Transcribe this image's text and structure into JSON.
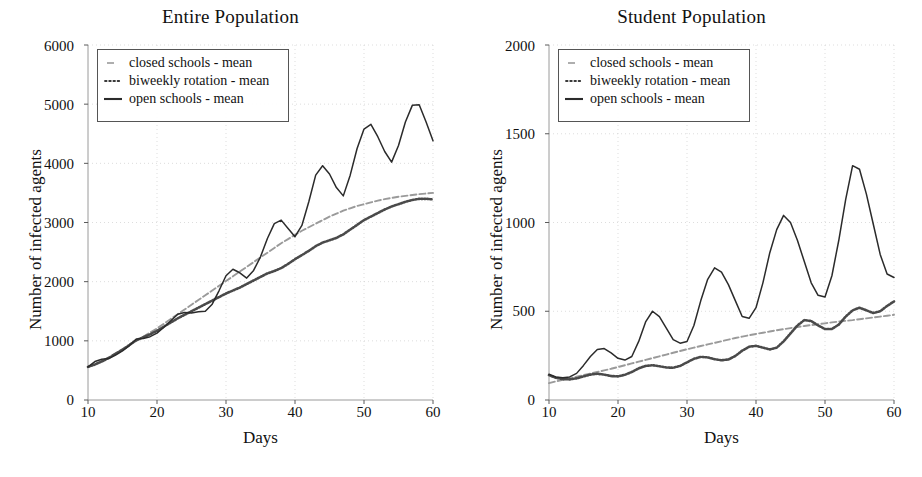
{
  "figure": {
    "background": "#ffffff",
    "ink": "#1a1a1a"
  },
  "legend": {
    "entries": [
      {
        "label": "closed schools - mean",
        "key": "dashed-line-key",
        "style": "dashed",
        "color": "#9a9a9a"
      },
      {
        "label": "biweekly rotation - mean",
        "key": "dotted-line-key",
        "style": "dotted",
        "color": "#4a4a4a"
      },
      {
        "label": "open schools - mean",
        "key": "solid-line-key",
        "style": "solid",
        "color": "#2b2b2b"
      }
    ]
  },
  "panels": [
    {
      "name": "entire-population",
      "title": "Entire Population",
      "xlabel": "Days",
      "ylabel": "Number of infected agents",
      "xticks": [
        "10",
        "20",
        "30",
        "40",
        "50",
        "60"
      ],
      "yticks": [
        "0",
        "1000",
        "2000",
        "3000",
        "4000",
        "5000",
        "6000"
      ]
    },
    {
      "name": "student-population",
      "title": "Student Population",
      "xlabel": "Days",
      "ylabel": "Number of infected agents",
      "xticks": [
        "10",
        "20",
        "30",
        "40",
        "50",
        "60"
      ],
      "yticks": [
        "0",
        "500",
        "1000",
        "1500",
        "2000"
      ]
    }
  ],
  "chart_data": [
    {
      "type": "line",
      "title": "Entire Population",
      "xlabel": "Days",
      "ylabel": "Number of infected agents",
      "xlim": [
        10,
        60
      ],
      "ylim": [
        0,
        6000
      ],
      "xticks": [
        10,
        20,
        30,
        40,
        50,
        60
      ],
      "yticks": [
        0,
        1000,
        2000,
        3000,
        4000,
        5000,
        6000
      ],
      "grid": true,
      "legend_position": "upper-left",
      "x": [
        10,
        11,
        12,
        13,
        14,
        15,
        16,
        17,
        18,
        19,
        20,
        21,
        22,
        23,
        24,
        25,
        26,
        27,
        28,
        29,
        30,
        31,
        32,
        33,
        34,
        35,
        36,
        37,
        38,
        39,
        40,
        41,
        42,
        43,
        44,
        45,
        46,
        47,
        48,
        49,
        50,
        51,
        52,
        53,
        54,
        55,
        56,
        57,
        58,
        59,
        60
      ],
      "series": [
        {
          "name": "closed schools - mean",
          "style": "dashed",
          "color": "#9a9a9a",
          "values": [
            560,
            610,
            660,
            720,
            790,
            860,
            930,
            1000,
            1070,
            1140,
            1210,
            1290,
            1370,
            1450,
            1530,
            1610,
            1690,
            1770,
            1850,
            1930,
            2010,
            2090,
            2170,
            2250,
            2330,
            2410,
            2490,
            2570,
            2650,
            2720,
            2790,
            2860,
            2920,
            2980,
            3040,
            3100,
            3150,
            3200,
            3240,
            3280,
            3310,
            3340,
            3370,
            3395,
            3415,
            3435,
            3450,
            3465,
            3480,
            3490,
            3500
          ]
        },
        {
          "name": "biweekly rotation - mean",
          "style": "dotted",
          "color": "#4a4a4a",
          "values": [
            560,
            600,
            650,
            710,
            780,
            850,
            930,
            1010,
            1060,
            1110,
            1170,
            1240,
            1310,
            1380,
            1440,
            1500,
            1560,
            1620,
            1680,
            1740,
            1800,
            1850,
            1900,
            1960,
            2020,
            2080,
            2140,
            2180,
            2230,
            2300,
            2380,
            2450,
            2520,
            2600,
            2660,
            2700,
            2740,
            2800,
            2880,
            2960,
            3040,
            3100,
            3160,
            3220,
            3270,
            3310,
            3350,
            3380,
            3400,
            3400,
            3390
          ]
        },
        {
          "name": "open schools - mean",
          "style": "solid",
          "color": "#2b2b2b",
          "values": [
            560,
            650,
            690,
            700,
            760,
            830,
            920,
            1030,
            1040,
            1070,
            1130,
            1230,
            1340,
            1450,
            1480,
            1470,
            1490,
            1500,
            1620,
            1850,
            2100,
            2210,
            2150,
            2060,
            2190,
            2420,
            2730,
            2980,
            3040,
            2900,
            2760,
            2950,
            3350,
            3800,
            3960,
            3820,
            3590,
            3450,
            3800,
            4250,
            4580,
            4660,
            4450,
            4200,
            4020,
            4300,
            4700,
            4980,
            4990,
            4700,
            4380
          ]
        }
      ]
    },
    {
      "type": "line",
      "title": "Student Population",
      "xlabel": "Days",
      "ylabel": "Number of infected agents",
      "xlim": [
        10,
        60
      ],
      "ylim": [
        0,
        2000
      ],
      "xticks": [
        10,
        20,
        30,
        40,
        50,
        60
      ],
      "yticks": [
        0,
        500,
        1000,
        1500,
        2000
      ],
      "grid": true,
      "legend_position": "upper-left",
      "x": [
        10,
        11,
        12,
        13,
        14,
        15,
        16,
        17,
        18,
        19,
        20,
        21,
        22,
        23,
        24,
        25,
        26,
        27,
        28,
        29,
        30,
        31,
        32,
        33,
        34,
        35,
        36,
        37,
        38,
        39,
        40,
        41,
        42,
        43,
        44,
        45,
        46,
        47,
        48,
        49,
        50,
        51,
        52,
        53,
        54,
        55,
        56,
        57,
        58,
        59,
        60
      ],
      "series": [
        {
          "name": "closed schools - mean",
          "style": "dashed",
          "color": "#9a9a9a",
          "values": [
            95,
            105,
            113,
            122,
            131,
            140,
            149,
            158,
            167,
            176,
            186,
            196,
            206,
            216,
            226,
            236,
            246,
            256,
            266,
            276,
            286,
            295,
            304,
            313,
            322,
            331,
            340,
            349,
            357,
            365,
            372,
            379,
            386,
            393,
            399,
            405,
            411,
            417,
            422,
            427,
            432,
            437,
            442,
            446,
            450,
            455,
            460,
            465,
            470,
            475,
            480
          ]
        },
        {
          "name": "biweekly rotation - mean",
          "style": "dotted",
          "color": "#4a4a4a",
          "values": [
            140,
            125,
            118,
            116,
            122,
            133,
            143,
            148,
            143,
            135,
            133,
            142,
            158,
            178,
            192,
            196,
            190,
            183,
            182,
            192,
            212,
            232,
            243,
            240,
            230,
            224,
            228,
            248,
            278,
            300,
            305,
            295,
            285,
            295,
            330,
            375,
            420,
            450,
            445,
            420,
            400,
            400,
            425,
            470,
            505,
            520,
            505,
            490,
            500,
            530,
            555
          ]
        },
        {
          "name": "open schools - mean",
          "style": "solid",
          "color": "#2b2b2b",
          "values": [
            145,
            130,
            125,
            130,
            150,
            195,
            245,
            285,
            290,
            265,
            235,
            225,
            245,
            330,
            440,
            500,
            470,
            405,
            340,
            320,
            330,
            420,
            560,
            680,
            745,
            720,
            650,
            560,
            470,
            460,
            520,
            660,
            830,
            960,
            1040,
            1000,
            900,
            780,
            660,
            590,
            580,
            700,
            900,
            1130,
            1320,
            1300,
            1160,
            990,
            820,
            710,
            690
          ]
        }
      ]
    }
  ],
  "chart_data_extra_peaks": {
    "entire_population_open_peaks": [
      1040,
      1500,
      2210,
      3040,
      3960,
      4660,
      4990
    ],
    "entire_population_open_troughs": [
      700,
      1470,
      2060,
      2760,
      3450,
      4020
    ],
    "student_population_open_peaks": [
      290,
      500,
      745,
      1040,
      1320,
      1500,
      1510
    ],
    "student_population_open_troughs": [
      125,
      225,
      320,
      460,
      590,
      770
    ]
  }
}
